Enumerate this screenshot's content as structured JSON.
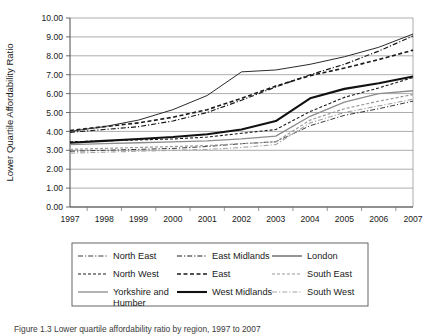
{
  "caption": {
    "text": "Figure 1.3  Lower quartile affordability ratio by region, 1997 to 2007"
  },
  "chart_data": {
    "type": "line",
    "title": "",
    "xlabel": "",
    "ylabel": "Lower Quartile Affordability Ratio",
    "ylim": [
      0.0,
      10.0
    ],
    "ytick_step": 1.0,
    "ytick_labels": [
      "0.00",
      "1.00",
      "2.00",
      "3.00",
      "4.00",
      "5.00",
      "6.00",
      "7.00",
      "8.00",
      "9.00",
      "10.00"
    ],
    "grid": "horizontal",
    "legend_position": "bottom",
    "legend_columns": 3,
    "categories": [
      "1997",
      "1998",
      "1999",
      "2000",
      "2001",
      "2002",
      "2003",
      "2004",
      "2005",
      "2006",
      "2007"
    ],
    "series": [
      {
        "name": "North East",
        "style": "dash-dot",
        "color": "#3a3a3a",
        "width": 1.0,
        "values": [
          2.95,
          3.0,
          3.05,
          3.1,
          3.2,
          3.35,
          3.45,
          4.3,
          4.85,
          5.2,
          5.6
        ]
      },
      {
        "name": "North West",
        "style": "dashed",
        "color": "#1a1a1a",
        "width": 1.1,
        "values": [
          3.45,
          3.5,
          3.55,
          3.6,
          3.7,
          3.9,
          4.1,
          5.05,
          5.8,
          6.3,
          6.85
        ]
      },
      {
        "name": "Yorkshire and Humber",
        "style": "solid",
        "color": "#8c8c8c",
        "width": 1.3,
        "values": [
          3.3,
          3.35,
          3.4,
          3.45,
          3.5,
          3.6,
          3.75,
          4.8,
          5.55,
          6.0,
          6.15
        ]
      },
      {
        "name": "East Midlands",
        "style": "dash-dot",
        "color": "#1a1a1a",
        "width": 1.2,
        "values": [
          3.95,
          4.1,
          4.25,
          4.55,
          5.0,
          5.65,
          6.35,
          7.0,
          7.55,
          8.25,
          9.05
        ]
      },
      {
        "name": "East",
        "style": "dashed",
        "color": "#1a1a1a",
        "width": 1.6,
        "values": [
          4.05,
          4.25,
          4.45,
          4.75,
          5.15,
          5.75,
          6.4,
          6.95,
          7.35,
          7.8,
          8.3
        ]
      },
      {
        "name": "West Midlands",
        "style": "solid",
        "color": "#111111",
        "width": 2.1,
        "values": [
          3.4,
          3.5,
          3.6,
          3.7,
          3.85,
          4.1,
          4.55,
          5.75,
          6.25,
          6.55,
          6.9
        ]
      },
      {
        "name": "London",
        "style": "solid",
        "color": "#2b2b2b",
        "width": 1.0,
        "values": [
          4.0,
          4.25,
          4.6,
          5.15,
          5.9,
          7.15,
          7.25,
          7.55,
          7.95,
          8.45,
          9.15
        ]
      },
      {
        "name": "South East",
        "style": "dashed",
        "color": "#9a9a9a",
        "width": 1.2,
        "values": [
          3.05,
          3.1,
          3.15,
          3.2,
          3.25,
          3.35,
          3.45,
          4.6,
          5.2,
          5.6,
          5.95
        ]
      },
      {
        "name": "South West",
        "style": "dash-dot",
        "color": "#a5a5a5",
        "width": 1.1,
        "values": [
          2.85,
          2.9,
          2.95,
          3.0,
          3.05,
          3.15,
          3.3,
          4.45,
          5.0,
          5.35,
          5.7
        ]
      }
    ],
    "legend_entries": [
      {
        "label": "North East",
        "column": 0,
        "row": 0
      },
      {
        "label": "North West",
        "column": 0,
        "row": 1
      },
      {
        "label": "Yorkshire and Humber",
        "column": 0,
        "row": 2
      },
      {
        "label": "East Midlands",
        "column": 1,
        "row": 0
      },
      {
        "label": "East",
        "column": 1,
        "row": 1
      },
      {
        "label": "West Midlands",
        "column": 1,
        "row": 2
      },
      {
        "label": "London",
        "column": 2,
        "row": 0
      },
      {
        "label": "South East",
        "column": 2,
        "row": 1
      },
      {
        "label": "South West",
        "column": 2,
        "row": 2
      }
    ]
  }
}
